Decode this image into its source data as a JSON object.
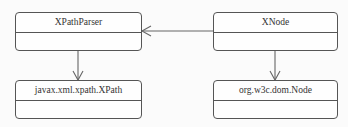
{
  "diagram": {
    "type": "uml-class-diagram",
    "classes": [
      {
        "id": "xpathparser",
        "name": "XPathParser"
      },
      {
        "id": "xnode",
        "name": "XNode"
      },
      {
        "id": "xpath",
        "name": "javax.xml.xpath.XPath"
      },
      {
        "id": "domnode",
        "name": "org.w3c.dom.Node"
      }
    ],
    "relations": [
      {
        "from": "XNode",
        "to": "XPathParser",
        "kind": "association"
      },
      {
        "from": "XPathParser",
        "to": "javax.xml.xpath.XPath",
        "kind": "association"
      },
      {
        "from": "XNode",
        "to": "org.w3c.dom.Node",
        "kind": "association"
      }
    ],
    "colors": {
      "line": "#555555",
      "background": "#fbfbfb",
      "text": "#333333"
    }
  }
}
